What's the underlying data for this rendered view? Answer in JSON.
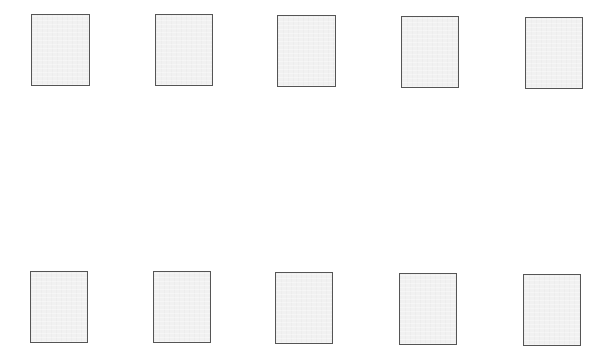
{
  "layout": {
    "rows": 2,
    "columns": 5
  },
  "thumbnails": [
    {
      "row": 0,
      "col": 0,
      "x": 31,
      "y": 14,
      "w": 59,
      "h": 72
    },
    {
      "row": 0,
      "col": 1,
      "x": 155,
      "y": 14,
      "w": 58,
      "h": 72
    },
    {
      "row": 0,
      "col": 2,
      "x": 277,
      "y": 15,
      "w": 59,
      "h": 72
    },
    {
      "row": 0,
      "col": 3,
      "x": 401,
      "y": 16,
      "w": 58,
      "h": 72
    },
    {
      "row": 0,
      "col": 4,
      "x": 525,
      "y": 17,
      "w": 58,
      "h": 72
    },
    {
      "row": 1,
      "col": 0,
      "x": 30,
      "y": 271,
      "w": 58,
      "h": 72
    },
    {
      "row": 1,
      "col": 1,
      "x": 153,
      "y": 271,
      "w": 58,
      "h": 72
    },
    {
      "row": 1,
      "col": 2,
      "x": 275,
      "y": 272,
      "w": 58,
      "h": 72
    },
    {
      "row": 1,
      "col": 3,
      "x": 399,
      "y": 273,
      "w": 58,
      "h": 72
    },
    {
      "row": 1,
      "col": 4,
      "x": 523,
      "y": 274,
      "w": 58,
      "h": 72
    }
  ],
  "colors": {
    "border": "#555555",
    "fill": "#f1f1f1",
    "background": "#ffffff"
  }
}
